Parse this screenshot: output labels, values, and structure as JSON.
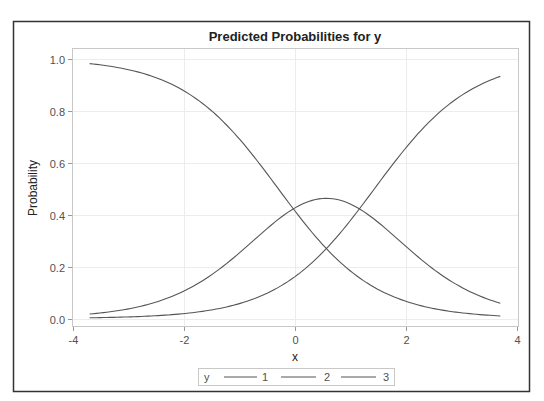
{
  "chart_data": {
    "type": "line",
    "title": "Predicted Probabilities for y",
    "xlabel": "x",
    "ylabel": "Probability",
    "xlim": [
      -4,
      4
    ],
    "ylim": [
      0.0,
      1.0
    ],
    "x_ticks": [
      "-4",
      "-2",
      "0",
      "2",
      "4"
    ],
    "y_ticks": [
      "0.0",
      "0.2",
      "0.4",
      "0.6",
      "0.8",
      "1.0"
    ],
    "grid": true,
    "legend_position": "bottom",
    "legend_title": "y",
    "x": [
      -3.7,
      -3.0,
      -2.0,
      -1.0,
      0.0,
      0.5,
      1.0,
      2.0,
      3.0,
      3.7
    ],
    "series": [
      {
        "name": "1",
        "values": [
          0.98,
          0.96,
          0.88,
          0.69,
          0.42,
          0.28,
          0.18,
          0.06,
          0.02,
          0.005
        ]
      },
      {
        "name": "2",
        "values": [
          0.017,
          0.036,
          0.1,
          0.25,
          0.41,
          0.46,
          0.45,
          0.33,
          0.17,
          0.07
        ]
      },
      {
        "name": "3",
        "values": [
          0.003,
          0.004,
          0.02,
          0.06,
          0.17,
          0.26,
          0.37,
          0.61,
          0.81,
          0.94
        ]
      }
    ],
    "model": {
      "kind": "cumulative_logit",
      "intercepts": [
        -0.35,
        1.65
      ],
      "slope": 1.15
    },
    "line_color": "#555555"
  }
}
